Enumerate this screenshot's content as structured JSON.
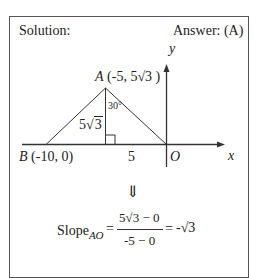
{
  "header": {
    "left": "Solution:",
    "right": "Answer: (A)"
  },
  "diagram": {
    "axis_y_label": "y",
    "axis_x_label": "x",
    "point_A_name": "A",
    "point_A_coords": "(-5, 5√3 )",
    "point_B_name": "B",
    "point_B_coords": "(-10, 0)",
    "origin_label": "O",
    "angle_label": "30°",
    "height_label_coef": "5",
    "height_label_radicand": "3",
    "base_label": "5"
  },
  "implies_symbol": "⇓",
  "formula": {
    "lhs": "Slope",
    "lhs_subscript": "AO",
    "equals1": "=",
    "numerator": "5√3 − 0",
    "denominator": "-5 − 0",
    "equals2": "=",
    "result": "-√3"
  }
}
